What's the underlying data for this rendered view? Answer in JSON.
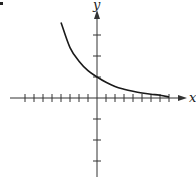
{
  "chart_data": {
    "type": "line",
    "title": "",
    "xlabel": "x",
    "ylabel": "y",
    "xlim": [
      -10,
      10
    ],
    "ylim": [
      -4,
      4
    ],
    "x_ticks": [
      -8,
      -7,
      -6,
      -5,
      -4,
      -3,
      -2,
      -1,
      1,
      2,
      3,
      4,
      5,
      6,
      7,
      8
    ],
    "y_ticks": [
      -3,
      -2,
      -1,
      1,
      2,
      3
    ],
    "tick_labels_shown": false,
    "grid": false,
    "legend": null,
    "series": [
      {
        "name": "exponential decay curve",
        "function_hint": "y ≈ (0.75)^x",
        "x": [
          -4,
          -3,
          -2,
          -1,
          0,
          1,
          2,
          3,
          4,
          5,
          6,
          7,
          8
        ],
        "y": [
          3.6,
          2.4,
          1.75,
          1.3,
          1.0,
          0.75,
          0.55,
          0.42,
          0.32,
          0.24,
          0.18,
          0.13,
          0.05
        ]
      }
    ],
    "y_intercept": 1,
    "horizontal_asymptote": 0
  },
  "labels": {
    "x_axis": "x",
    "y_axis": "y"
  },
  "colors": {
    "axis": "#333333",
    "curve": "#1a1a1a",
    "background": "#ffffff"
  },
  "layout": {
    "origin_px": [
      97,
      98
    ],
    "x_unit_px": 9,
    "y_unit_px": 21
  }
}
